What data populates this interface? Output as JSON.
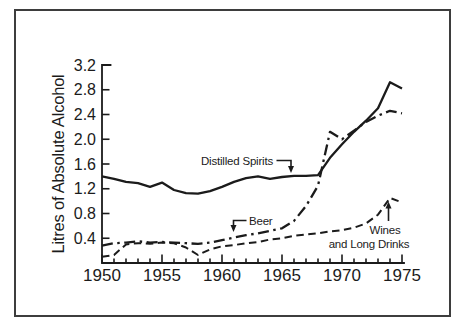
{
  "figure": {
    "background_color": "#ffffff",
    "ink_color": "#1b1b1b",
    "border_color": "#3d3d3d"
  },
  "chart_data": {
    "type": "line",
    "title": "",
    "xlabel": "",
    "ylabel": "Litres of Absolute Alcohol",
    "xlim": [
      1950,
      1975
    ],
    "ylim": [
      0,
      3.2
    ],
    "grid": false,
    "legend_position": "inline-annotations",
    "x_ticks": [
      1950,
      1955,
      1960,
      1965,
      1970,
      1975
    ],
    "x_minor_tick_interval": 1,
    "y_ticks": [
      "0.4",
      "0.8",
      "1.2",
      "1.6",
      "2.0",
      "2.4",
      "2.8",
      "3.2"
    ],
    "x": [
      1950,
      1951,
      1952,
      1953,
      1954,
      1955,
      1956,
      1957,
      1958,
      1959,
      1960,
      1961,
      1962,
      1963,
      1964,
      1965,
      1966,
      1967,
      1968,
      1969,
      1970,
      1971,
      1972,
      1973,
      1974,
      1975
    ],
    "series": [
      {
        "name": "Distilled Spirits",
        "line_style": "solid",
        "values": [
          1.4,
          1.36,
          1.31,
          1.29,
          1.23,
          1.3,
          1.18,
          1.13,
          1.12,
          1.16,
          1.23,
          1.31,
          1.37,
          1.4,
          1.36,
          1.39,
          1.41,
          1.41,
          1.42,
          1.7,
          1.92,
          2.12,
          2.3,
          2.5,
          2.92,
          2.82
        ]
      },
      {
        "name": "Beer",
        "line_style": "dash-dot",
        "values": [
          0.28,
          0.32,
          0.33,
          0.35,
          0.33,
          0.34,
          0.33,
          0.32,
          0.31,
          0.33,
          0.37,
          0.41,
          0.45,
          0.48,
          0.52,
          0.56,
          0.68,
          0.92,
          1.25,
          2.12,
          2.0,
          2.14,
          2.28,
          2.38,
          2.46,
          2.42
        ]
      },
      {
        "name": "Wines and Long Drinks",
        "line_style": "dashed",
        "values": [
          0.1,
          0.13,
          0.3,
          0.32,
          0.31,
          0.33,
          0.32,
          0.25,
          0.13,
          0.22,
          0.27,
          0.29,
          0.32,
          0.34,
          0.38,
          0.4,
          0.44,
          0.46,
          0.48,
          0.51,
          0.53,
          0.57,
          0.64,
          0.78,
          1.05,
          0.98
        ]
      }
    ],
    "annotations": [
      {
        "text": "Distilled Spirits"
      },
      {
        "text": "Beer"
      },
      {
        "text": "Wines",
        "text2": "and Long Drinks"
      }
    ]
  }
}
